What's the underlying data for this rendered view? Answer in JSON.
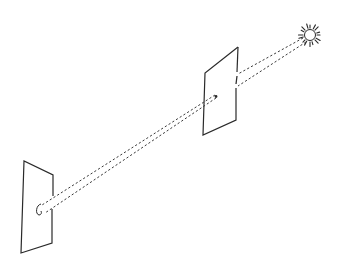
{
  "diagram": {
    "colors": {
      "line": "#2a2a2a",
      "background": "#ffffff"
    },
    "elements": {
      "sun": {
        "cx": 310,
        "cy": 35,
        "r": 5.5,
        "ray_inner": 7,
        "ray_outer": 11.5,
        "ray_count": 16
      },
      "pinhole_screen": {
        "corners": [
          [
            205,
            73
          ],
          [
            238,
            47
          ],
          [
            236,
            120
          ],
          [
            203,
            135
          ]
        ],
        "pinhole": [
          216,
          96
        ]
      },
      "projection_screen": {
        "corners": [
          [
            24,
            161
          ],
          [
            53,
            175
          ],
          [
            52,
            243
          ],
          [
            21,
            253
          ]
        ],
        "image_spot": [
          38,
          210
        ]
      },
      "beams": [
        {
          "from": [
            306,
            36
          ],
          "to": [
            238,
            74
          ]
        },
        {
          "from": [
            308,
            41
          ],
          "to": [
            238,
            86
          ]
        },
        {
          "from": [
            216,
            95
          ],
          "to": [
            42,
            205
          ]
        },
        {
          "from": [
            217,
            98
          ],
          "to": [
            45,
            213
          ]
        }
      ]
    }
  }
}
